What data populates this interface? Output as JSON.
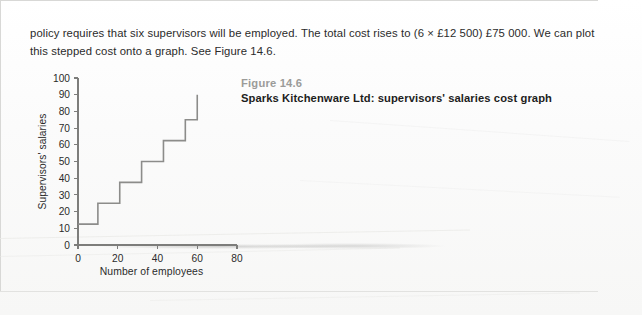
{
  "page": {
    "body_text": "policy requires that six supervisors will be employed. The total cost rises to (6 × £12 500) £75 000. We can plot this stepped cost onto a graph. See Figure 14.6."
  },
  "figure": {
    "number_label": "Figure 14.6",
    "title": "Sparks Kitchenware Ltd: supervisors' salaries cost graph"
  },
  "chart_data": {
    "type": "line",
    "step": "post",
    "title": "Sparks Kitchenware Ltd: supervisors' salaries cost graph",
    "xlabel": "Number of employees",
    "ylabel": "Supervisors' salaries",
    "xlim": [
      0,
      80
    ],
    "ylim": [
      0,
      100
    ],
    "xticks": [
      0,
      20,
      40,
      60,
      80
    ],
    "yticks": [
      0,
      10,
      20,
      30,
      40,
      50,
      60,
      70,
      80,
      90,
      100
    ],
    "xtick_labels": [
      "0",
      "20",
      "40",
      "60",
      "80"
    ],
    "ytick_labels": [
      "0",
      "10",
      "20",
      "30",
      "40",
      "50",
      "60",
      "70",
      "80",
      "90",
      "100"
    ],
    "grid": false,
    "legend": null,
    "line_color": "#8c8c8a",
    "axis_color": "#7d7d7b",
    "series": [
      {
        "name": "Supervisors' salaries",
        "points": [
          {
            "x": 0,
            "y": 12.5
          },
          {
            "x": 10,
            "y": 12.5
          },
          {
            "x": 10,
            "y": 25
          },
          {
            "x": 21,
            "y": 25
          },
          {
            "x": 21,
            "y": 37.5
          },
          {
            "x": 32,
            "y": 37.5
          },
          {
            "x": 32,
            "y": 50
          },
          {
            "x": 43,
            "y": 50
          },
          {
            "x": 43,
            "y": 62.5
          },
          {
            "x": 54,
            "y": 62.5
          },
          {
            "x": 54,
            "y": 75
          },
          {
            "x": 60,
            "y": 75
          },
          {
            "x": 60,
            "y": 90
          }
        ]
      }
    ],
    "step_levels": [
      12.5,
      25,
      37.5,
      50,
      62.5,
      75,
      90
    ],
    "step_breakpoints": [
      10,
      21,
      32,
      43,
      54,
      60
    ]
  }
}
